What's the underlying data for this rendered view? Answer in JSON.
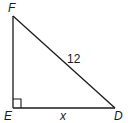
{
  "diagram": {
    "type": "right-triangle",
    "colors": {
      "stroke": "#1a1a1a",
      "background": "#ffffff"
    },
    "vertices": [
      {
        "label": "F",
        "x": 13,
        "y": 16
      },
      {
        "label": "E",
        "x": 13,
        "y": 108
      },
      {
        "label": "D",
        "x": 115,
        "y": 108
      }
    ],
    "right_angle_at": "E",
    "sides": {
      "hypotenuse_FD": {
        "label": "12"
      },
      "base_ED": {
        "label": "x"
      }
    },
    "labels": {
      "F": "F",
      "E": "E",
      "D": "D",
      "hypotenuse": "12",
      "base": "x"
    }
  }
}
